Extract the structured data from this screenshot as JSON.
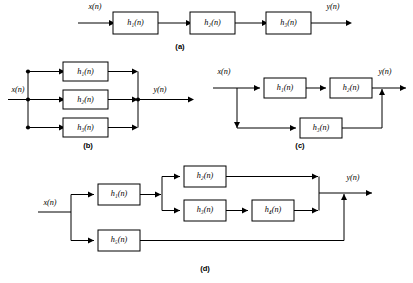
{
  "figure": {
    "background": "#ffffff",
    "line_color": "#000000",
    "width": 413,
    "height": 283
  },
  "signals": {
    "input": "x(n)",
    "output": "y(n)"
  },
  "captions": {
    "a": "(a)",
    "b": "(b)",
    "c": "(c)",
    "d": "(d)"
  },
  "blocks": {
    "h1": "h₁(n)",
    "h2": "h₂(n)",
    "h3": "h₃(n)",
    "h4": "h₄(n)",
    "h5": "h₅(n)"
  },
  "subfigures": [
    {
      "id": "a",
      "caption": "(a)",
      "topology": "cascade",
      "input": "x(n)",
      "output": "y(n)",
      "blocks": [
        "h₁(n)",
        "h₂(n)",
        "h₃(n)"
      ],
      "description": "Three systems in cascade (series): x(n) into h1, h1 into h2, h2 into h3, h3 to y(n)."
    },
    {
      "id": "b",
      "caption": "(b)",
      "topology": "parallel",
      "input": "x(n)",
      "output": "y(n)",
      "blocks": [
        "h₁(n)",
        "h₂(n)",
        "h₃(n)"
      ],
      "description": "Three systems in parallel: x(n) splits at a node into h1, h2, h3; outputs sum at a node to y(n)."
    },
    {
      "id": "c",
      "caption": "(c)",
      "topology": "cascade-parallel",
      "input": "x(n)",
      "output": "y(n)",
      "blocks": [
        "h₁(n)",
        "h₂(n)",
        "h₃(n)"
      ],
      "description": "Cascade of h1 and h2 in the upper branch, in parallel with h3 in the lower branch; branches sum to y(n)."
    },
    {
      "id": "d",
      "caption": "(d)",
      "topology": "combined",
      "input": "x(n)",
      "output": "y(n)",
      "blocks": [
        "h₁(n)",
        "h₂(n)",
        "h₃(n)",
        "h₄(n)",
        "h₅(n)"
      ],
      "description": "x(n) splits into an upper path through h1, which splits into h2 and the cascade h3 to h4; these recombine and sum with the lower branch h5 to form y(n)."
    }
  ],
  "block_instances": [
    {
      "subfigure": "a",
      "name": "h1",
      "label": "h₁(n)",
      "x": 113,
      "y": 12,
      "w": 45,
      "h": 22
    },
    {
      "subfigure": "a",
      "name": "h2",
      "label": "h₂(n)",
      "x": 190,
      "y": 12,
      "w": 45,
      "h": 22
    },
    {
      "subfigure": "a",
      "name": "h3",
      "label": "h₃(n)",
      "x": 266,
      "y": 12,
      "w": 45,
      "h": 22
    },
    {
      "subfigure": "b",
      "name": "h1",
      "label": "h₁(n)",
      "x": 63,
      "y": 62,
      "w": 45,
      "h": 19
    },
    {
      "subfigure": "b",
      "name": "h2",
      "label": "h₂(n)",
      "x": 63,
      "y": 90,
      "w": 45,
      "h": 19
    },
    {
      "subfigure": "b",
      "name": "h3",
      "label": "h₃(n)",
      "x": 63,
      "y": 118,
      "w": 45,
      "h": 19
    },
    {
      "subfigure": "c",
      "name": "h1",
      "label": "h₁(n)",
      "x": 264,
      "y": 78,
      "w": 42,
      "h": 20
    },
    {
      "subfigure": "c",
      "name": "h2",
      "label": "h₂(n)",
      "x": 330,
      "y": 78,
      "w": 42,
      "h": 20
    },
    {
      "subfigure": "c",
      "name": "h3",
      "label": "h₃(n)",
      "x": 300,
      "y": 118,
      "w": 42,
      "h": 20
    },
    {
      "subfigure": "d",
      "name": "h1",
      "label": "h₁(n)",
      "x": 98,
      "y": 184,
      "w": 42,
      "h": 21
    },
    {
      "subfigure": "d",
      "name": "h2",
      "label": "h₂(n)",
      "x": 184,
      "y": 166,
      "w": 42,
      "h": 21
    },
    {
      "subfigure": "d",
      "name": "h3",
      "label": "h₃(n)",
      "x": 184,
      "y": 200,
      "w": 42,
      "h": 21
    },
    {
      "subfigure": "d",
      "name": "h4",
      "label": "h₄(n)",
      "x": 252,
      "y": 200,
      "w": 42,
      "h": 21
    },
    {
      "subfigure": "d",
      "name": "h5",
      "label": "h₅(n)",
      "x": 98,
      "y": 230,
      "w": 42,
      "h": 21
    }
  ]
}
